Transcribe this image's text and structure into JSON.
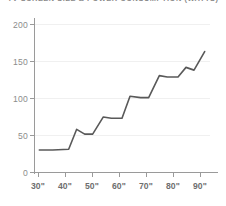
{
  "chart_data": {
    "type": "line",
    "title": "TV SCREEN SIZE & POWER CONSUMPTION (WATTS)",
    "xlabel": "",
    "ylabel": "",
    "xlim": [
      28,
      94
    ],
    "ylim": [
      0,
      215
    ],
    "grid": true,
    "legend": null,
    "y_ticks": [
      0,
      50,
      100,
      150,
      200
    ],
    "y_tick_labels": [
      "0",
      "50",
      "100",
      "150",
      "200"
    ],
    "x_ticks": [
      30,
      40,
      50,
      60,
      70,
      80,
      90
    ],
    "x_tick_labels": [
      "30\"",
      "40\"",
      "50\"",
      "60\"",
      "70\"",
      "80\"",
      "90\""
    ],
    "series": [
      {
        "name": "Power Consumption",
        "color": "#595959",
        "x": [
          30,
          35,
          41,
          44,
          47,
          50,
          54,
          57,
          61,
          64,
          68,
          71,
          75,
          78,
          82,
          85,
          88,
          92
        ],
        "values": [
          32,
          32,
          33,
          62,
          55,
          55,
          80,
          78,
          78,
          110,
          108,
          108,
          140,
          138,
          138,
          152,
          148,
          175
        ]
      }
    ]
  },
  "axes": {
    "y_label_color": "#8c8c8c",
    "x_label_color": "#6e6e6e",
    "axis_color": "#9a9a9a",
    "grid_color": "#f0f0f0"
  }
}
